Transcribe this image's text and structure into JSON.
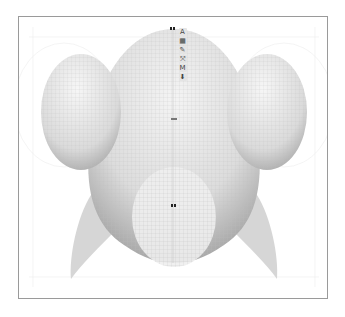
{
  "viewport": {
    "name": "3D model viewport",
    "border_color": "#9a9a9a",
    "background": "#ffffff"
  },
  "model": {
    "description": "wireframe fish-like body with two side spheres, lower belly sphere and two fins",
    "mesh_color": "#cfcfcf",
    "shade_light": "#f2f2f2",
    "shade_dark": "#9c9c9c",
    "fin_color": "#d6d6d6"
  },
  "toolbar": {
    "tools": [
      {
        "id": "text",
        "label": "A",
        "icon": "text-icon"
      },
      {
        "id": "layer",
        "label": "▦",
        "icon": "layer-icon"
      },
      {
        "id": "brush",
        "label": "✎",
        "icon": "brush-icon"
      },
      {
        "id": "transform",
        "label": "⤧",
        "icon": "transform-icon"
      },
      {
        "id": "mask",
        "label": "M",
        "icon": "mask-icon"
      },
      {
        "id": "down",
        "label": "⬇",
        "icon": "down-arrow-icon"
      }
    ]
  },
  "handles": {
    "top": {
      "x": 151,
      "y": 11
    },
    "center": {
      "x": 152,
      "y": 101
    },
    "belly": {
      "x": 152,
      "y": 188
    }
  }
}
